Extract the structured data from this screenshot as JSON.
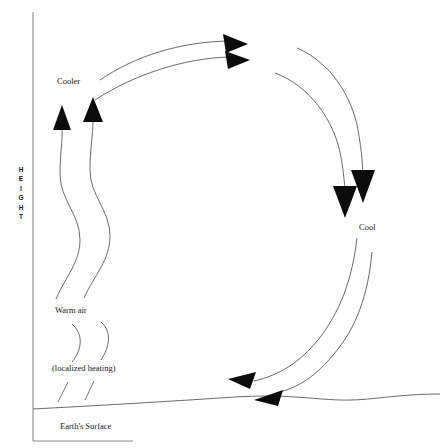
{
  "diagram": {
    "type": "convection-cell",
    "axis": {
      "y_label_text": "HEIGHT",
      "y_label_letters": [
        "H",
        "E",
        "I",
        "G",
        "H",
        "T"
      ],
      "orientation": "vertical",
      "color": "#8a8a8a"
    },
    "labels": {
      "cooler": "Cooler",
      "cool": "Cool",
      "warm_air": "Warm air",
      "localized_heating": "(localized heating)",
      "earth_surface": "Earth's Surface"
    },
    "colors": {
      "line": "#595959",
      "arrow": "#0b0b0b",
      "axis": "#8a8a8a",
      "surface": "#6b6b6b",
      "background": "#ffffff",
      "text": "#1a1a1a"
    },
    "flow": {
      "rising_limb": "warm air rises on the left in two wavy streamlines",
      "top_limb": "air travels right across the top toward the cooler region",
      "descending_limb": "cool air sinks on the right in two curved streamlines",
      "return_limb": "air returns left along the Earth's surface",
      "arrow_counts": {
        "up": 2,
        "right": 2,
        "down": 2,
        "left": 2
      }
    }
  }
}
